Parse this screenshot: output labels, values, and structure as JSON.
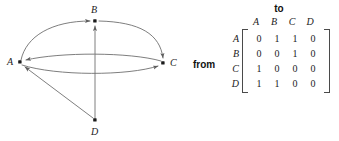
{
  "figure": {
    "type": "directed-graph-with-adjacency-matrix",
    "line_color": "#6f6f6f",
    "node_color": "#1b1b1b",
    "text_color": "#1b1b1b",
    "background": "#ffffff"
  },
  "graph": {
    "nodes": [
      {
        "id": "A",
        "label": "A",
        "x": 20,
        "y": 62,
        "label_x": 7,
        "label_y": 57
      },
      {
        "id": "B",
        "label": "B",
        "x": 95,
        "y": 21,
        "label_x": 91,
        "label_y": 5
      },
      {
        "id": "C",
        "label": "C",
        "x": 163,
        "y": 63,
        "label_x": 170,
        "label_y": 58
      },
      {
        "id": "D",
        "label": "D",
        "x": 95,
        "y": 120,
        "label_x": 91,
        "label_y": 127
      }
    ],
    "edges": [
      {
        "from": "A",
        "to": "B",
        "style": "curve-upper-left"
      },
      {
        "from": "A",
        "to": "C",
        "style": "curve-lower"
      },
      {
        "from": "B",
        "to": "C",
        "style": "curve-upper-right"
      },
      {
        "from": "C",
        "to": "A",
        "style": "curve-middle"
      },
      {
        "from": "D",
        "to": "A",
        "style": "straight-diagonal"
      },
      {
        "from": "D",
        "to": "B",
        "style": "straight-vertical"
      }
    ]
  },
  "matrix": {
    "to_label": "to",
    "from_label": "from",
    "column_headers": [
      "A",
      "B",
      "C",
      "D"
    ],
    "row_headers": [
      "A",
      "B",
      "C",
      "D"
    ],
    "rows": [
      [
        "0",
        "1",
        "1",
        "0"
      ],
      [
        "0",
        "0",
        "1",
        "0"
      ],
      [
        "1",
        "0",
        "0",
        "0"
      ],
      [
        "1",
        "1",
        "0",
        "0"
      ]
    ]
  }
}
